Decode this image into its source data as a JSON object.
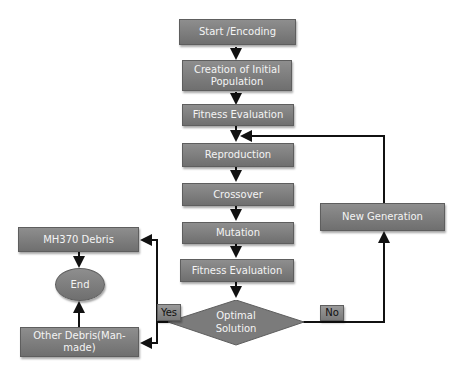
{
  "flowchart": {
    "nodes": {
      "start": "Start /Encoding",
      "init_population": "Creation of Initial Population",
      "fitness1": "Fitness Evaluation",
      "reproduction": "Reproduction",
      "crossover": "Crossover",
      "mutation": "Mutation",
      "fitness2": "Fitness Evaluation",
      "decision": "Optimal Solution",
      "new_generation": "New Generation",
      "mh370": "MH370 Debris",
      "end": "End",
      "other_debris": "Other Debris(Man-made)"
    },
    "labels": {
      "yes": "Yes",
      "no": "No"
    },
    "colors": {
      "box_fill": "#7f7f7f",
      "line": "#111111",
      "text": "#f4f4f4"
    }
  }
}
